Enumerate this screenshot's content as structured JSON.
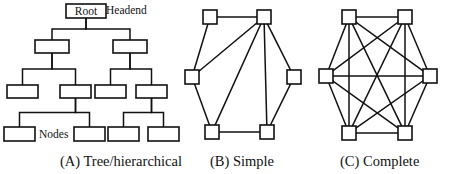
{
  "figure": {
    "background_color": "#ffffff",
    "line_color": "#111111",
    "node_fill": "#ffffff"
  },
  "panels": [
    {
      "id": "panel-a",
      "caption": "(A) Tree/hierarchical",
      "caption_x": 60,
      "caption_y": 166,
      "labels": [
        {
          "name": "headend-label",
          "text": "Headend",
          "x": 106,
          "y": 14
        },
        {
          "name": "nodes-label",
          "text": "Nodes",
          "x": 39,
          "y": 138
        }
      ],
      "nodes": [
        {
          "id": "root",
          "text": "Root",
          "x": 66,
          "y": 4,
          "w": 40,
          "h": 14
        },
        {
          "id": "a1",
          "text": "",
          "x": 35,
          "y": 40,
          "w": 34,
          "h": 13
        },
        {
          "id": "a2",
          "text": "",
          "x": 113,
          "y": 40,
          "w": 34,
          "h": 13
        },
        {
          "id": "b1",
          "text": "",
          "x": 7,
          "y": 85,
          "w": 31,
          "h": 13
        },
        {
          "id": "b2",
          "text": "",
          "x": 60,
          "y": 85,
          "w": 31,
          "h": 13
        },
        {
          "id": "b3",
          "text": "",
          "x": 95,
          "y": 85,
          "w": 31,
          "h": 13
        },
        {
          "id": "b4",
          "text": "",
          "x": 136,
          "y": 85,
          "w": 31,
          "h": 13
        },
        {
          "id": "c1",
          "text": "",
          "x": 4,
          "y": 127,
          "w": 31,
          "h": 14
        },
        {
          "id": "c2",
          "text": "",
          "x": 74,
          "y": 127,
          "w": 31,
          "h": 14
        },
        {
          "id": "c3",
          "text": "",
          "x": 108,
          "y": 127,
          "w": 31,
          "h": 14
        },
        {
          "id": "c4",
          "text": "",
          "x": 148,
          "y": 127,
          "w": 31,
          "h": 14
        }
      ],
      "links": [
        {
          "from": "root",
          "to": "a1"
        },
        {
          "from": "root",
          "to": "a2"
        },
        {
          "from": "a1",
          "to": "b1"
        },
        {
          "from": "a1",
          "to": "b2"
        },
        {
          "from": "a2",
          "to": "b3"
        },
        {
          "from": "a2",
          "to": "b4"
        },
        {
          "from": "b2",
          "to": "c1"
        },
        {
          "from": "b2",
          "to": "c2"
        },
        {
          "from": "b4",
          "to": "c3"
        },
        {
          "from": "b4",
          "to": "c4"
        }
      ]
    },
    {
      "id": "panel-b",
      "caption": "(B) Simple",
      "caption_x": 32,
      "caption_y": 166,
      "node_size": 14,
      "nodes": [
        {
          "id": "tl",
          "cx": 32,
          "cy": 17
        },
        {
          "id": "tr",
          "cx": 86,
          "cy": 17
        },
        {
          "id": "lm",
          "cx": 14,
          "cy": 77
        },
        {
          "id": "rm",
          "cx": 116,
          "cy": 77
        },
        {
          "id": "bl",
          "cx": 34,
          "cy": 132
        },
        {
          "id": "br",
          "cx": 89,
          "cy": 132
        }
      ],
      "edges": [
        {
          "from": "tl",
          "to": "tr"
        },
        {
          "from": "tl",
          "to": "lm"
        },
        {
          "from": "lm",
          "to": "bl"
        },
        {
          "from": "bl",
          "to": "br"
        },
        {
          "from": "br",
          "to": "rm"
        },
        {
          "from": "rm",
          "to": "tr"
        },
        {
          "from": "tr",
          "to": "lm"
        },
        {
          "from": "tr",
          "to": "bl"
        },
        {
          "from": "tr",
          "to": "br"
        }
      ]
    },
    {
      "id": "panel-c",
      "caption": "(C) Complete",
      "caption_x": 32,
      "caption_y": 166,
      "node_size": 14,
      "nodes": [
        {
          "id": "tl",
          "cx": 41,
          "cy": 17
        },
        {
          "id": "tr",
          "cx": 97,
          "cy": 17
        },
        {
          "id": "lm",
          "cx": 18,
          "cy": 76
        },
        {
          "id": "rm",
          "cx": 122,
          "cy": 76
        },
        {
          "id": "bl",
          "cx": 41,
          "cy": 133
        },
        {
          "id": "br",
          "cx": 97,
          "cy": 133
        }
      ],
      "edges": [
        {
          "from": "tl",
          "to": "tr"
        },
        {
          "from": "tl",
          "to": "lm"
        },
        {
          "from": "tl",
          "to": "rm"
        },
        {
          "from": "tl",
          "to": "bl"
        },
        {
          "from": "tl",
          "to": "br"
        },
        {
          "from": "tr",
          "to": "lm"
        },
        {
          "from": "tr",
          "to": "rm"
        },
        {
          "from": "tr",
          "to": "bl"
        },
        {
          "from": "tr",
          "to": "br"
        },
        {
          "from": "lm",
          "to": "rm"
        },
        {
          "from": "lm",
          "to": "bl"
        },
        {
          "from": "lm",
          "to": "br"
        },
        {
          "from": "rm",
          "to": "bl"
        },
        {
          "from": "rm",
          "to": "br"
        },
        {
          "from": "bl",
          "to": "br"
        }
      ]
    }
  ]
}
